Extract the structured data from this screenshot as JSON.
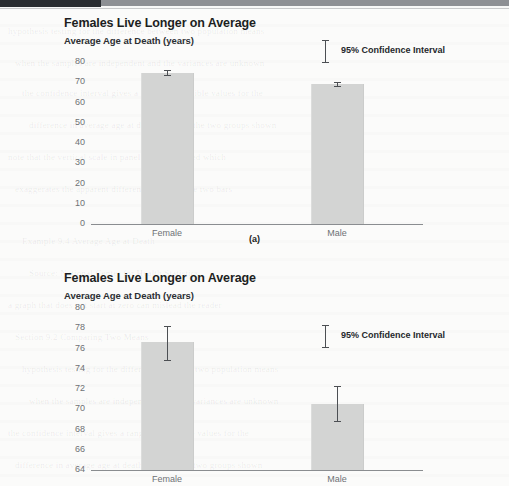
{
  "page": {
    "header_strip_color": "#2a2d31",
    "background_color": "#fbfbfa",
    "bleed_lines": [
      "hypothesis testing for the difference between two population means",
      "when the samples are independent and the variances are unknown",
      "the confidence interval gives a range of plausible values for the",
      "difference in average age at death between the two groups shown",
      "note that the vertical scale in panel (b) is truncated which",
      "exaggerates the apparent difference between the two bars",
      "Example 9.4 Average Age at Death",
      "Source: National Center for Health Statistics",
      "a graph that does not start at zero can mislead the reader",
      "Section 9.2 Comparing Two Means"
    ]
  },
  "figures": [
    {
      "id": "a",
      "caption": "(a)",
      "title": "Females Live Longer on Average",
      "subtitle": "Average Age at Death (years)",
      "legend_label": "95% Confidence Interval",
      "chart_data": {
        "type": "bar",
        "title": "Females Live Longer on Average",
        "subtitle": "Average Age at Death (years)",
        "xlabel": "",
        "ylabel": "Average Age at Death (years)",
        "categories": [
          "Female",
          "Male"
        ],
        "values": [
          74.7,
          69.1
        ],
        "error_low": [
          73.4,
          68.0
        ],
        "error_high": [
          76.1,
          70.3
        ],
        "ylim": [
          0,
          80
        ],
        "yticks": [
          0,
          10,
          20,
          30,
          40,
          50,
          60,
          70,
          80
        ],
        "ytick_labels": [
          "0",
          "10",
          "20",
          "30",
          "40",
          "50",
          "60",
          "70",
          "80"
        ],
        "grid": false,
        "legend": [
          "95% Confidence Interval"
        ],
        "legend_position": "inside-top-right",
        "bar_color": "#d3d4d3",
        "error_bar_color": "#4c4f53"
      }
    },
    {
      "id": "b",
      "caption": "",
      "title": "Females Live Longer on Average",
      "subtitle": "Average Age at Death (years)",
      "legend_label": "95% Confidence Interval",
      "chart_data": {
        "type": "bar",
        "title": "Females Live Longer on Average",
        "subtitle": "Average Age at Death (years)",
        "xlabel": "",
        "ylabel": "Average Age at Death (years)",
        "categories": [
          "Female",
          "Male"
        ],
        "values": [
          76.6,
          70.5
        ],
        "error_low": [
          74.9,
          68.8
        ],
        "error_high": [
          78.2,
          72.3
        ],
        "ylim": [
          64,
          80
        ],
        "yticks": [
          64,
          66,
          68,
          70,
          72,
          74,
          76,
          78,
          80
        ],
        "ytick_labels": [
          "64",
          "66",
          "68",
          "70",
          "72",
          "74",
          "76",
          "78",
          "80"
        ],
        "grid": false,
        "legend": [
          "95% Confidence Interval"
        ],
        "legend_position": "inside-top-right",
        "bar_color": "#d3d4d3",
        "error_bar_color": "#4c4f53"
      }
    }
  ]
}
